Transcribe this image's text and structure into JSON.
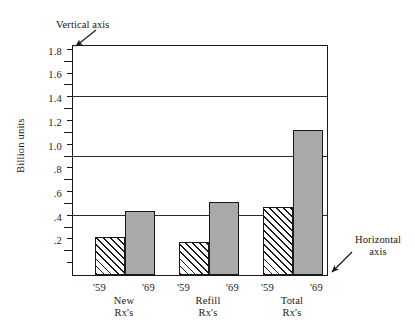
{
  "chart_data": {
    "type": "bar",
    "title": "",
    "xlabel": "",
    "ylabel": "Billion units",
    "ylim": [
      0,
      1.95
    ],
    "grid": true,
    "gridlines": [
      0.5,
      1.0,
      1.5
    ],
    "legend": "none",
    "categories": [
      "New Rx's",
      "Refill Rx's",
      "Total Rx's"
    ],
    "series": [
      {
        "name": "'59",
        "values": [
          0.32,
          0.28,
          0.57
        ],
        "fill": "hatched"
      },
      {
        "name": "'69",
        "values": [
          0.54,
          0.62,
          1.22
        ],
        "fill": "gray"
      }
    ],
    "ytick_labels": [
      "1.8",
      "1.6",
      "1.4",
      "1.2",
      "1.0",
      ".8",
      ".6",
      ".4",
      ".2"
    ],
    "ytick_values": [
      1.8,
      1.6,
      1.4,
      1.2,
      1.0,
      0.8,
      0.6,
      0.4,
      0.2
    ],
    "yminor_values": [
      1.9,
      1.7,
      1.5,
      1.3,
      1.1,
      0.9,
      0.7,
      0.5,
      0.3,
      0.1
    ],
    "annotations": [
      {
        "text": "Vertical axis",
        "target": "y-axis-top"
      },
      {
        "text": "Horizontal axis",
        "target": "x-axis-right"
      }
    ]
  },
  "axis_title": {
    "y": "Billion units"
  },
  "annotations": {
    "vertical_axis": "Vertical axis",
    "horizontal_axis_line1": "Horizontal",
    "horizontal_axis_line2": "axis"
  },
  "yticks": [
    {
      "label": "1.8",
      "value": 1.8
    },
    {
      "label": "1.6",
      "value": 1.6
    },
    {
      "label": "1.4",
      "value": 1.4
    },
    {
      "label": "1.2",
      "value": 1.2
    },
    {
      "label": "1.0",
      "value": 1.0
    },
    {
      "label": ".8",
      "value": 0.8
    },
    {
      "label": ".6",
      "value": 0.6
    },
    {
      "label": ".4",
      "value": 0.4
    },
    {
      "label": ".2",
      "value": 0.2
    }
  ],
  "groups": [
    {
      "name": "New Rx's",
      "line1": "New",
      "line2": "Rx's",
      "bars": [
        {
          "year": "'59",
          "value": 0.32,
          "fill": "hatched"
        },
        {
          "year": "'69",
          "value": 0.54,
          "fill": "gray"
        }
      ]
    },
    {
      "name": "Refill Rx's",
      "line1": "Refill",
      "line2": "Rx's",
      "bars": [
        {
          "year": "'59",
          "value": 0.28,
          "fill": "hatched"
        },
        {
          "year": "'69",
          "value": 0.62,
          "fill": "gray"
        }
      ]
    },
    {
      "name": "Total Rx's",
      "line1": "Total",
      "line2": "Rx's",
      "bars": [
        {
          "year": "'59",
          "value": 0.57,
          "fill": "hatched"
        },
        {
          "year": "'69",
          "value": 1.22,
          "fill": "gray"
        }
      ]
    }
  ],
  "colors": {
    "gray_bar": "#a9a9a9",
    "outline": "#1a1a1a",
    "background": "#ffffff"
  }
}
